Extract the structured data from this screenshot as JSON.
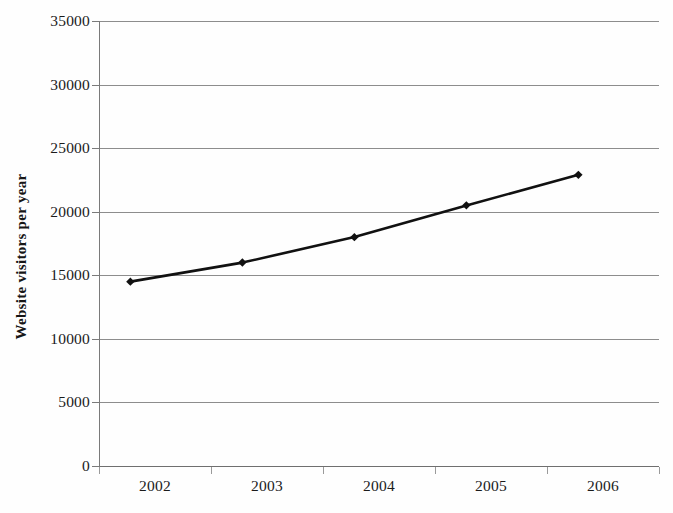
{
  "chart_data": {
    "type": "line",
    "title": "",
    "subtitle": "",
    "xlabel": "",
    "ylabel": "Website visitors per year",
    "categories": [
      "2002",
      "2003",
      "2004",
      "2005",
      "2006"
    ],
    "values": [
      14500,
      16000,
      18000,
      20500,
      22900
    ],
    "series": [
      {
        "name": "Website visitors per year",
        "values": [
          14500,
          16000,
          18000,
          20500,
          22900
        ]
      }
    ],
    "ylim": [
      0,
      35000
    ],
    "ytick_labels": [
      "0",
      "5000",
      "10000",
      "15000",
      "20000",
      "25000",
      "30000",
      "35000"
    ],
    "ytick_values": [
      0,
      5000,
      10000,
      15000,
      20000,
      25000,
      30000,
      35000
    ],
    "xtick_labels": [
      "2002",
      "2003",
      "2004",
      "2005",
      "2006"
    ],
    "grid": "horizontal",
    "legend": "none",
    "marker": "diamond",
    "line_color": "#111111",
    "marker_color": "#111111",
    "gridline_color": "#8d8d8d",
    "axis_color": "#7a7a7a",
    "background_color": "#ffffff",
    "annotations": []
  }
}
